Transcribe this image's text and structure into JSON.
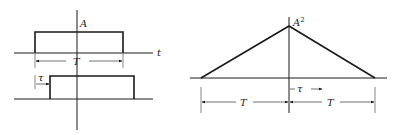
{
  "left_top": {
    "amplitude_label": "A",
    "axis_label": "t",
    "width_label": "T"
  },
  "left_bottom": {
    "shift_label": "τ"
  },
  "right": {
    "peak_label": "A",
    "peak_label_sup": "2",
    "shift_label": "τ",
    "left_width_label": "T",
    "right_width_label": "T"
  },
  "colors": {
    "ink": "#1a1a1a",
    "dim": "#333333",
    "background": "#ffffff"
  }
}
